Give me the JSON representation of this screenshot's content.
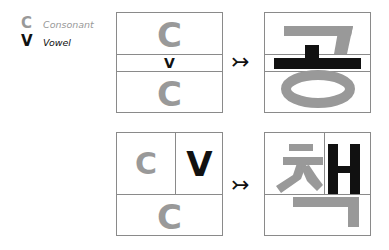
{
  "colors": {
    "consonant": "#999999",
    "vowel": "#111111",
    "border": "#8a8a8a"
  },
  "legend": {
    "consonant": {
      "symbol": "C",
      "label": "Consonant"
    },
    "vowel": {
      "symbol": "V",
      "label": "Vowel"
    }
  },
  "rows": [
    {
      "layout": "vertical-stack",
      "template": {
        "top": "C",
        "middle": "V",
        "bottom": "C"
      },
      "arrow": "↣",
      "result_syllable": "공",
      "result_parts": {
        "initial": "ㄱ",
        "vowel": "ㅗ",
        "final": "ㅇ"
      }
    },
    {
      "layout": "side-by-side-with-bottom",
      "template": {
        "top_left": "C",
        "top_right": "V",
        "bottom": "C"
      },
      "arrow": "↣",
      "result_syllable": "책",
      "result_parts": {
        "initial": "ㅊ",
        "vowel": "ㅐ",
        "final": "ㄱ"
      }
    }
  ]
}
